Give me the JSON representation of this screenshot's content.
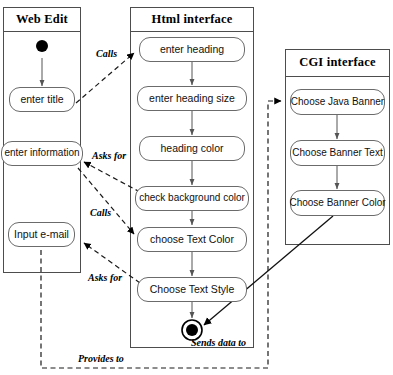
{
  "diagram": {
    "type": "uml-activity-diagram",
    "stroke_color": "#4d4d4d",
    "box_border_color": "#6b6b6b",
    "background": "#ffffff"
  },
  "lanes": [
    {
      "id": "web-edit",
      "title": "Web Edit"
    },
    {
      "id": "html-interface",
      "title": "Html interface"
    },
    {
      "id": "cgi-interface",
      "title": "CGI interface"
    }
  ],
  "activities": {
    "web_edit": [
      {
        "id": "enter-title",
        "label": "enter title"
      },
      {
        "id": "enter-information",
        "label": "enter information"
      },
      {
        "id": "input-email",
        "label": "Input e-mail"
      }
    ],
    "html_interface": [
      {
        "id": "enter-heading",
        "label": "enter heading"
      },
      {
        "id": "enter-heading-size",
        "label": "enter heading size"
      },
      {
        "id": "heading-color",
        "label": "heading color"
      },
      {
        "id": "check-background-color",
        "label": "check background color"
      },
      {
        "id": "choose-text-color",
        "label": "choose Text Color"
      },
      {
        "id": "choose-text-style",
        "label": "Choose Text Style"
      }
    ],
    "cgi_interface": [
      {
        "id": "choose-java-banner",
        "label": "Choose Java Banner"
      },
      {
        "id": "choose-banner-text",
        "label": "Choose Banner Text"
      },
      {
        "id": "choose-banner-color",
        "label": "Choose Banner Color"
      }
    ]
  },
  "edge_labels": [
    {
      "id": "calls-1",
      "label": "Calls"
    },
    {
      "id": "asks-for-1",
      "label": "Asks for"
    },
    {
      "id": "calls-2",
      "label": "Calls"
    },
    {
      "id": "asks-for-2",
      "label": "Asks for"
    },
    {
      "id": "sends-data",
      "label": "Sends data to"
    },
    {
      "id": "provides-to",
      "label": "Provides to"
    }
  ]
}
